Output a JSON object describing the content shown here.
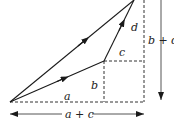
{
  "figure": {
    "type": "vector-addition-diagram",
    "labels": {
      "a": "a",
      "b": "b",
      "c": "c",
      "d": "d",
      "sum_horizontal": "a + c",
      "sum_vertical": "b + d"
    },
    "vectors": [
      {
        "name": "first-vector",
        "components": [
          "a",
          "b"
        ]
      },
      {
        "name": "second-vector",
        "components": [
          "c",
          "d"
        ]
      },
      {
        "name": "resultant-vector",
        "components": [
          "a + c",
          "b + d"
        ]
      }
    ]
  }
}
